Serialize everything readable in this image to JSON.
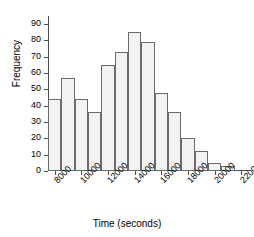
{
  "chart_data": {
    "type": "bar",
    "title": "",
    "xlabel": "Time (seconds)",
    "ylabel": "Frequency",
    "bin_width": 1000,
    "bin_start": 7500,
    "categories": [
      "7500-8500",
      "8500-9500",
      "9500-10500",
      "10500-11500",
      "11500-12500",
      "12500-13500",
      "13500-14500",
      "14500-15500",
      "15500-16500",
      "16500-17500",
      "17500-18500",
      "18500-19500",
      "19500-20500",
      "20500-21500"
    ],
    "bin_centers": [
      8000,
      9000,
      10000,
      11000,
      12000,
      13000,
      14000,
      15000,
      16000,
      17000,
      18000,
      19000,
      20000,
      21000
    ],
    "values": [
      44,
      57,
      44,
      36,
      65,
      73,
      85,
      79,
      48,
      36,
      20,
      12,
      5,
      3
    ],
    "xlim": [
      7500,
      22500
    ],
    "ylim": [
      0,
      95
    ],
    "x_ticks": [
      8000,
      10000,
      12000,
      14000,
      16000,
      18000,
      20000,
      22000
    ],
    "x_tick_labels": [
      "8000",
      "10000",
      "12000",
      "14000",
      "16000",
      "18000",
      "20000",
      "22000"
    ],
    "y_ticks": [
      0,
      10,
      20,
      30,
      40,
      50,
      60,
      70,
      80,
      90
    ],
    "y_tick_labels": [
      "0",
      "10",
      "20",
      "30",
      "40",
      "50",
      "60",
      "70",
      "80",
      "90"
    ],
    "grid": false,
    "legend": "none",
    "bar_fill_color": "#f2f2f2",
    "bar_edge_color": "#6b6b6b",
    "axis_color": "#4d4d4d",
    "text_color": "#000000",
    "background_color": "#ffffff"
  }
}
